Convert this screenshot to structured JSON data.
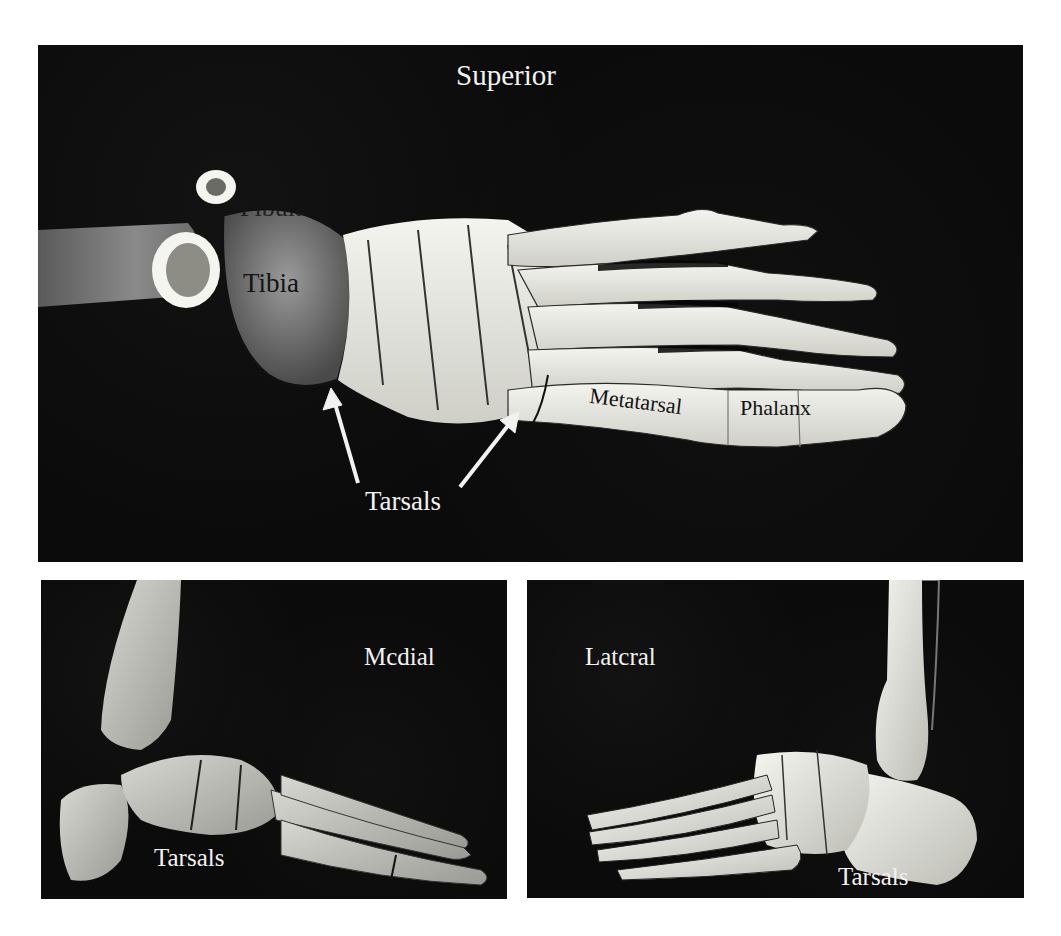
{
  "figure": {
    "panels": [
      {
        "id": "superior",
        "view_label": "Superior",
        "labels": {
          "fibula": "Fibula",
          "tibia": "Tibia",
          "metatarsal": "Metatarsal",
          "phalanx": "Phalanx",
          "tarsals": "Tarsals"
        },
        "arrow_count": 2
      },
      {
        "id": "medial",
        "view_label": "Mcdial",
        "labels": {
          "tarsals": "Tarsals"
        }
      },
      {
        "id": "lateral",
        "view_label": "Latcral",
        "labels": {
          "tarsals": "Tarsals"
        }
      }
    ],
    "colors": {
      "background": "#0b0b0b",
      "bone": "#e8e8e2",
      "page": "#ffffff",
      "label_light": "#f2f2f2",
      "label_dark": "#141414"
    }
  }
}
